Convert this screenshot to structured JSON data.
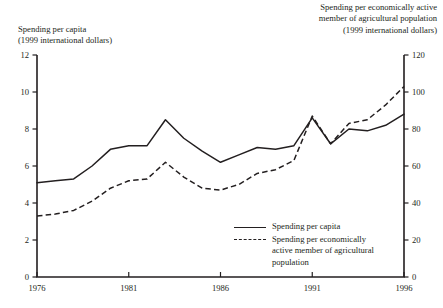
{
  "chart_data": {
    "type": "line",
    "title": "",
    "xlabel": "",
    "left_axis_title": "Spending per capita\n(1999 international dollars)",
    "right_axis_title": "Spending per economically active\nmember of agricultural population\n(1999 international dollars)",
    "x": [
      1976,
      1977,
      1978,
      1979,
      1980,
      1981,
      1982,
      1983,
      1984,
      1985,
      1986,
      1987,
      1988,
      1989,
      1990,
      1991,
      1992,
      1993,
      1994,
      1995,
      1996
    ],
    "xticks": [
      "1976",
      "1981",
      "1986",
      "1991",
      "1996"
    ],
    "xlim": [
      1976,
      1996
    ],
    "ylim": [
      0,
      12
    ],
    "yticks": [
      "0",
      "2",
      "4",
      "6",
      "8",
      "10",
      "12"
    ],
    "y2lim": [
      0,
      120
    ],
    "y2ticks": [
      "0",
      "20",
      "40",
      "60",
      "80",
      "100",
      "120"
    ],
    "grid": false,
    "legend_position": "inside-bottom-right",
    "series": [
      {
        "name": "Spending per capita",
        "axis": "left",
        "style": "solid",
        "values": [
          5.1,
          5.2,
          5.3,
          6.0,
          6.9,
          7.1,
          7.1,
          8.5,
          7.5,
          6.8,
          6.2,
          6.6,
          7.0,
          6.9,
          7.1,
          8.6,
          7.2,
          8.0,
          7.9,
          8.2,
          8.8
        ]
      },
      {
        "name": "Spending per economically\nactive member of agricultural\npopulation",
        "axis": "right",
        "style": "dashed",
        "values": [
          33,
          34,
          36,
          41,
          48,
          52,
          53,
          62,
          54,
          48,
          47,
          50,
          56,
          58,
          63,
          87,
          72,
          83,
          85,
          93,
          103
        ]
      }
    ]
  },
  "legend": {
    "items": [
      {
        "label": "Spending per capita",
        "style": "solid"
      },
      {
        "label": "Spending per economically\nactive member of agricultural\npopulation",
        "style": "dashed"
      }
    ]
  }
}
